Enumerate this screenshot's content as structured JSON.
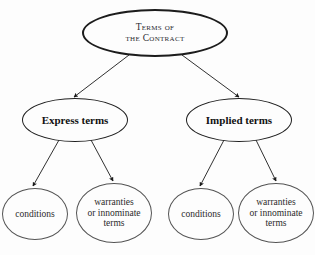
{
  "diagram": {
    "type": "tree",
    "background_color": "#fdfdfd",
    "edge_color": "#1a1a1a",
    "nodes": [
      {
        "id": "root",
        "tier": "root",
        "shape": "ellipse",
        "text": "Terms of\nthe Contract",
        "line1": "Terms of",
        "line2": "the Contract",
        "style": "small-caps",
        "x": 82,
        "y": 9,
        "w": 146,
        "h": 48,
        "stroke_color": "#1c1c1c"
      },
      {
        "id": "express",
        "tier": "branch",
        "shape": "ellipse",
        "text": "Express terms",
        "style": "bold",
        "x": 22,
        "y": 98,
        "w": 106,
        "h": 44,
        "stroke_color": "#1f1f1f"
      },
      {
        "id": "implied",
        "tier": "branch",
        "shape": "ellipse",
        "text": "Implied terms",
        "style": "bold",
        "x": 186,
        "y": 98,
        "w": 106,
        "h": 44,
        "stroke_color": "#1f1f1f"
      },
      {
        "id": "express-conditions",
        "tier": "leaf",
        "shape": "ellipse",
        "text": "conditions",
        "style": "regular",
        "x": 2,
        "y": 188,
        "w": 66,
        "h": 52,
        "stroke_color": "#555555"
      },
      {
        "id": "express-warranties",
        "tier": "leaf",
        "shape": "ellipse",
        "text": "warranties\nor innominate\nterms",
        "line1": "warranties",
        "line2": "or innominate",
        "line3": "terms",
        "style": "regular",
        "x": 76,
        "y": 183,
        "w": 76,
        "h": 60,
        "stroke_color": "#555555"
      },
      {
        "id": "implied-conditions",
        "tier": "leaf",
        "shape": "ellipse",
        "text": "conditions",
        "style": "regular",
        "x": 168,
        "y": 188,
        "w": 66,
        "h": 52,
        "stroke_color": "#555555"
      },
      {
        "id": "implied-warranties",
        "tier": "leaf",
        "shape": "ellipse",
        "text": "warranties\nor innominate\nterms",
        "line1": "warranties",
        "line2": "or innominate",
        "line3": "terms",
        "style": "regular",
        "x": 238,
        "y": 183,
        "w": 76,
        "h": 60,
        "stroke_color": "#555555"
      }
    ],
    "edges": [
      {
        "id": "root-to-express",
        "from": "root",
        "to": "express",
        "arrowhead": "solid-triangle"
      },
      {
        "id": "root-to-implied",
        "from": "root",
        "to": "implied",
        "arrowhead": "solid-triangle"
      },
      {
        "id": "express-to-conditions",
        "from": "express",
        "to": "express-conditions",
        "arrowhead": "solid-triangle"
      },
      {
        "id": "express-to-warranties",
        "from": "express",
        "to": "express-warranties",
        "arrowhead": "solid-triangle"
      },
      {
        "id": "implied-to-conditions",
        "from": "implied",
        "to": "implied-conditions",
        "arrowhead": "solid-triangle"
      },
      {
        "id": "implied-to-warranties",
        "from": "implied",
        "to": "implied-warranties",
        "arrowhead": "solid-triangle"
      }
    ]
  }
}
